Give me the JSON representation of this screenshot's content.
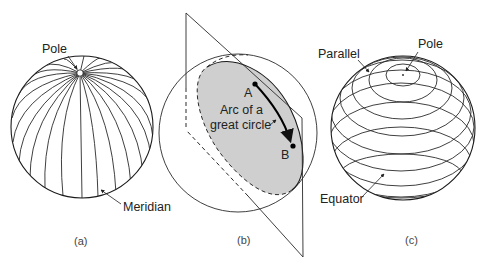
{
  "figure": {
    "panels": [
      {
        "id": "a",
        "caption": "(a)",
        "description": "Sphere with meridians converging at the pole",
        "labels": {
          "pole": "Pole",
          "meridian": "Meridian"
        }
      },
      {
        "id": "b",
        "caption": "(b)",
        "description": "Plane through sphere center cutting a great circle; arc from A to B",
        "labels": {
          "arc_line1": "Arc of a",
          "arc_line2": "great circle",
          "point_a": "A",
          "point_b": "B"
        }
      },
      {
        "id": "c",
        "caption": "(c)",
        "description": "Sphere with parallels of latitude around the pole",
        "labels": {
          "parallel": "Parallel",
          "pole": "Pole",
          "equator": "Equator"
        }
      }
    ],
    "colors": {
      "line": "#1a1a1a",
      "great_circle_fill": "#cfcfcf",
      "background": "#ffffff"
    }
  }
}
